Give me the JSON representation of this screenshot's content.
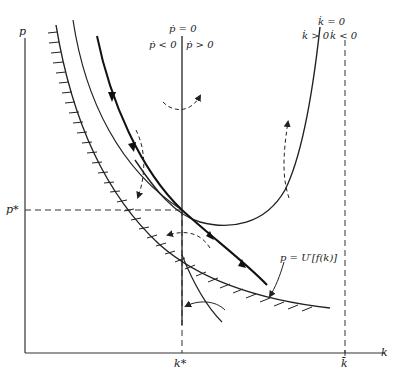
{
  "diagram": {
    "type": "phase-diagram",
    "axes": {
      "y_label": "p",
      "x_label": "k"
    },
    "equilibrium": {
      "k_label": "k*",
      "p_label": "p*"
    },
    "k_bar_label": "k̄",
    "loci": {
      "p_dot_zero": {
        "label": "ṗ = 0",
        "left_region": "ṗ < 0",
        "right_region": "ṗ > 0"
      },
      "k_dot_zero": {
        "label": "k̇ = 0",
        "left_region": "k̇ > 0",
        "right_region": "k̇ < 0"
      }
    },
    "boundary_curve": {
      "label": "p = U′[f(k)]"
    },
    "colors": {
      "ink": "#222222",
      "background": "#ffffff"
    }
  }
}
